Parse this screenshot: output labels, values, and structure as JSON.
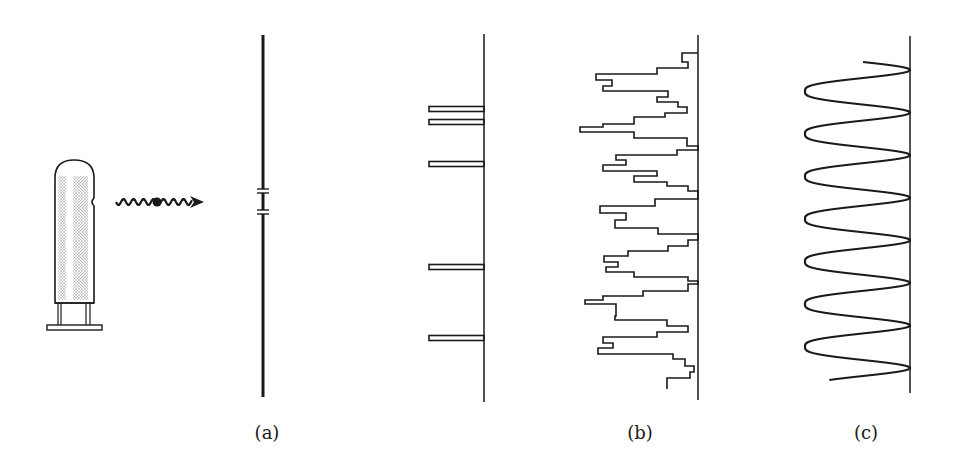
{
  "figure": {
    "panel_labels": [
      {
        "id": "a",
        "text": "(a)",
        "x": 267,
        "y": 422
      },
      {
        "id": "b",
        "text": "(b)",
        "x": 640,
        "y": 422
      },
      {
        "id": "c",
        "text": "(c)",
        "x": 866,
        "y": 422
      }
    ],
    "colors": {
      "ink": "#1a1a1a",
      "shade": "#b8b8b8",
      "background": "#ffffff"
    },
    "source": {
      "type": "electron-gun-tube",
      "body": {
        "x1": 55,
        "x2": 94,
        "top": 160,
        "bottom": 303
      },
      "base_plate": {
        "x1": 47,
        "x2": 102,
        "y1": 325,
        "y2": 330
      }
    },
    "particle_wave": {
      "icon": "wavy-arrow-with-particle",
      "x_start": 116,
      "x_end": 204,
      "y": 202,
      "wavelength": 10,
      "amplitude": 3,
      "particle_x": 157
    },
    "slit_screen": {
      "x": 263,
      "top": 35,
      "bottom": 397,
      "slits": [
        {
          "y1": 189,
          "y2": 193
        },
        {
          "y1": 210,
          "y2": 214
        }
      ]
    },
    "panel_a": {
      "screen_x": 484,
      "top": 34,
      "bottom": 402,
      "bar_left_x": 429,
      "bar_height": 5,
      "bars_y": [
        109,
        122,
        164,
        267,
        338
      ]
    },
    "panel_b": {
      "screen_x": 698,
      "top": 35,
      "bottom": 400,
      "steps": [
        [
          53,
          682
        ],
        [
          62,
          688
        ],
        [
          68,
          657
        ],
        [
          74,
          596
        ],
        [
          80,
          612
        ],
        [
          86,
          603
        ],
        [
          91,
          668
        ],
        [
          97,
          657
        ],
        [
          102,
          678
        ],
        [
          107,
          687
        ],
        [
          113,
          665
        ],
        [
          117,
          634
        ],
        [
          124,
          603
        ],
        [
          127,
          580
        ],
        [
          132,
          634
        ],
        [
          138,
          687
        ],
        [
          146,
          698
        ],
        [
          150,
          677
        ],
        [
          155,
          616
        ],
        [
          160,
          626
        ],
        [
          165,
          603
        ],
        [
          171,
          657
        ],
        [
          176,
          634
        ],
        [
          182,
          667
        ],
        [
          186,
          688
        ],
        [
          191,
          698
        ],
        [
          199,
          655
        ],
        [
          206,
          600
        ],
        [
          213,
          626
        ],
        [
          220,
          615
        ],
        [
          228,
          658
        ],
        [
          234,
          698
        ],
        [
          240,
          688
        ],
        [
          246,
          668
        ],
        [
          251,
          628
        ],
        [
          256,
          604
        ],
        [
          262,
          618
        ],
        [
          267,
          606
        ],
        [
          272,
          634
        ],
        [
          277,
          688
        ],
        [
          281,
          698
        ],
        [
          284,
          688
        ],
        [
          291,
          643
        ],
        [
          296,
          603
        ],
        [
          300,
          585
        ],
        [
          304,
          616
        ],
        [
          311,
          616
        ],
        [
          316,
          615
        ],
        [
          320,
          667
        ],
        [
          326,
          688
        ],
        [
          332,
          657
        ],
        [
          337,
          603
        ],
        [
          343,
          613
        ],
        [
          348,
          598
        ],
        [
          354,
          673
        ],
        [
          359,
          685
        ],
        [
          366,
          694
        ],
        [
          372,
          690
        ],
        [
          378,
          667
        ],
        [
          384,
          667
        ]
      ]
    },
    "panel_c": {
      "screen_x": 910,
      "top": 36,
      "bottom": 393,
      "curve_left_x": 805,
      "curve_start_y": 62,
      "curve_end_y": 380,
      "maxima_y": [
        70,
        110,
        151,
        196,
        242,
        283,
        326,
        368
      ],
      "minima_y": [
        90,
        130,
        173,
        220,
        263,
        303,
        345
      ]
    }
  }
}
